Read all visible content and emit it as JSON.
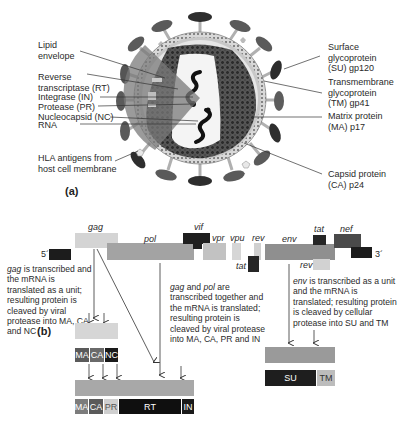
{
  "panel_a": {
    "label": "(a)",
    "left_labels": [
      {
        "id": "lipid",
        "lines": [
          "Lipid",
          "envelope"
        ]
      },
      {
        "id": "rt",
        "lines": [
          "Reverse",
          "transcriptase (RT)"
        ]
      },
      {
        "id": "in",
        "lines": [
          "Integrase (IN)"
        ]
      },
      {
        "id": "pr",
        "lines": [
          "Protease (PR)"
        ]
      },
      {
        "id": "nc",
        "lines": [
          "Nucleocapsid (NC)"
        ]
      },
      {
        "id": "rna",
        "lines": [
          "RNA"
        ]
      },
      {
        "id": "hla",
        "lines": [
          "HLA antigens from",
          "host cell membrane"
        ]
      }
    ],
    "right_labels": [
      {
        "id": "su",
        "lines": [
          "Surface",
          "glycoprotein",
          "(SU) gp120"
        ]
      },
      {
        "id": "tm",
        "lines": [
          "Transmembrane",
          "glycoprotein",
          "(TM) gp41"
        ]
      },
      {
        "id": "ma",
        "lines": [
          "Matrix protein",
          "(MA) p17"
        ]
      },
      {
        "id": "ca",
        "lines": [
          "Capsid protein",
          "(CA) p24"
        ]
      }
    ]
  },
  "panel_b": {
    "label": "(b)",
    "genome": {
      "five_prime": "5´",
      "three_prime": "3´",
      "ltr": "LTR",
      "genes": [
        {
          "name": "gag"
        },
        {
          "name": "pol"
        },
        {
          "name": "vif"
        },
        {
          "name": "vpr"
        },
        {
          "name": "vpu"
        },
        {
          "name": "rev"
        },
        {
          "name": "tat"
        },
        {
          "name": "env"
        },
        {
          "name": "tat"
        },
        {
          "name": "nef"
        },
        {
          "name": "rev"
        }
      ]
    },
    "descriptions": {
      "gag": {
        "gene": "gag",
        "text": " is transcribed and the mRNA is translated as a unit; resulting protein is cleaved by viral protease into MA, CA, and NC"
      },
      "gagpol": {
        "gene1": "gag",
        "and": " and ",
        "gene2": "pol",
        "text": " are transcribed together and the mRNA is translated; resulting protein is cleaved by viral protease into MA, CA, PR and IN"
      },
      "env": {
        "gene": "env",
        "text": " is transcribed as a unit and the mRNA is translated; resulting protein is cleaved by cellular protease into SU and TM"
      }
    },
    "gag_products": [
      "MA",
      "CA",
      "NC"
    ],
    "gagpol_products": [
      "MA",
      "CA",
      "PR",
      "RT",
      "IN"
    ],
    "env_products": [
      "SU",
      "TM"
    ]
  }
}
